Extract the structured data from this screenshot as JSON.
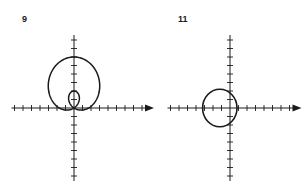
{
  "graphs": [
    {
      "label": "9",
      "description": "Polar limaçon with inner loop",
      "origin": [
        74,
        108
      ],
      "tick_spacing": 8.5,
      "x_ticks_left": 7,
      "x_ticks_right": 8,
      "y_ticks_up": 8,
      "y_ticks_down": 8,
      "curve": "limacon",
      "params": {
        "a": 2,
        "b": 4,
        "direction": "sin"
      }
    },
    {
      "label": "11",
      "description": "Polar circle shifted left",
      "origin": [
        230,
        108
      ],
      "tick_spacing": 8.5,
      "x_ticks_left": 7,
      "x_ticks_right": 7,
      "y_ticks_up": 8,
      "y_ticks_down": 8,
      "curve": "circle",
      "params": {
        "cx": -1.2,
        "cy": 0,
        "r": 2.2
      }
    }
  ],
  "colors": {
    "ink": "#1a1a1a",
    "background": "#ffffff"
  }
}
